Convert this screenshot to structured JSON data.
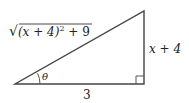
{
  "diagram": {
    "type": "right-triangle",
    "colors": {
      "stroke": "#444444",
      "text": "#222222",
      "background": "#ffffff"
    },
    "vertices": {
      "left": [
        15,
        84
      ],
      "right_bottom": [
        144,
        84
      ],
      "right_top": [
        144,
        11
      ]
    },
    "labels": {
      "hypotenuse": {
        "radical": "√",
        "radicand": "(x + 4)",
        "exponent": "2",
        "suffix": " + 9"
      },
      "vertical_side": "x + 4",
      "base": "3",
      "angle": "θ"
    },
    "right_angle_marker_size": 8
  }
}
